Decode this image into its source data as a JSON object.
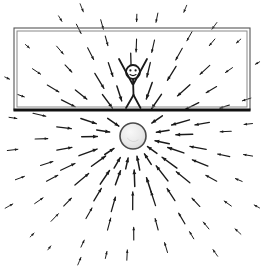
{
  "figure": {
    "title": "Radial gravitational field converging on a sphere",
    "background_color": "#ffffff",
    "ink_color": "#1a1a1a",
    "width": 267,
    "height": 270,
    "style": "hand-drawn pencil sketch"
  },
  "room": {
    "label": "room-enclosure",
    "x": 14,
    "y": 28,
    "width": 236,
    "height": 82,
    "border_color": "#555555",
    "inner_border_color": "#888888",
    "floor_color": "#111111",
    "floor_thickness": 3,
    "double_border": true
  },
  "person": {
    "label": "stick-figure",
    "head_center_x": 133,
    "head_center_y": 72,
    "head_radius": 7,
    "body_bottom_y": 108,
    "arms": "raised-v",
    "face": "two-eyes-and-mouth",
    "color": "#1a1a1a"
  },
  "sphere": {
    "label": "massive-sphere",
    "center_x": 133,
    "center_y": 136,
    "radius": 13,
    "fill_color": "#e6e6e6",
    "stroke_color": "#4a4a4a",
    "highlight_color": "#f7f7f7"
  },
  "field": {
    "label": "gravitational-field-arrows",
    "direction": "inward",
    "arrow_color": "#1a1a1a",
    "center_x": 133,
    "center_y": 136,
    "rings": [
      {
        "radius": 34,
        "count": 16,
        "length": 13,
        "weight": 1.5,
        "offset": 11
      },
      {
        "radius": 55,
        "count": 20,
        "length": 17,
        "weight": 1.5,
        "offset": 0
      },
      {
        "radius": 78,
        "count": 22,
        "length": 16,
        "weight": 1.3,
        "offset": 8
      },
      {
        "radius": 100,
        "count": 24,
        "length": 12,
        "weight": 1.1,
        "offset": 0
      },
      {
        "radius": 122,
        "count": 26,
        "length": 9,
        "weight": 1.0,
        "offset": 7
      },
      {
        "radius": 144,
        "count": 26,
        "length": 7,
        "weight": 0.9,
        "offset": 0
      }
    ]
  },
  "chart_data": {
    "type": "scatter",
    "title": "Radial gravitational field converging on a sphere",
    "xlabel": "",
    "ylabel": "",
    "xlim": [
      0,
      267
    ],
    "ylim": [
      0,
      270
    ],
    "grid": false,
    "legend": "none",
    "annotations": [
      "Arrows point radially inward toward the sphere at (133, 136)",
      "Arrow magnitude decreases with distance from the sphere",
      "A stick figure stands on the floor of a rectangular room above the sphere"
    ]
  }
}
